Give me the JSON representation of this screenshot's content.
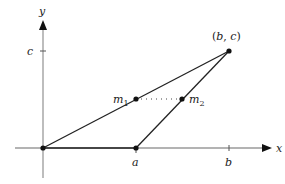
{
  "diagram": {
    "type": "coordinate-geometry-triangle",
    "axes": {
      "x_label": "x",
      "y_label": "y",
      "x_ticks": [
        {
          "label": "a",
          "px": 136
        },
        {
          "label": "b",
          "px": 229
        }
      ],
      "y_ticks": [
        {
          "label": "c",
          "py": 51
        }
      ],
      "color": "#999999"
    },
    "points": {
      "origin": {
        "label": "",
        "px": [
          43,
          148
        ]
      },
      "a": {
        "label": "a",
        "px": [
          136,
          148
        ]
      },
      "bc": {
        "label": "(b, c)",
        "px": [
          229,
          51
        ]
      },
      "m1": {
        "label": "m",
        "sub": "1",
        "px": [
          136,
          99
        ]
      },
      "m2": {
        "label": "m",
        "sub": "2",
        "px": [
          182,
          99
        ]
      }
    },
    "segments": [
      {
        "from": "origin",
        "to": "bc",
        "style": "solid"
      },
      {
        "from": "a",
        "to": "bc",
        "style": "solid"
      },
      {
        "from": "origin",
        "to": "a",
        "style": "solid"
      },
      {
        "from": "m1",
        "to": "m2",
        "style": "dotted"
      }
    ],
    "line_color": "#222222"
  }
}
